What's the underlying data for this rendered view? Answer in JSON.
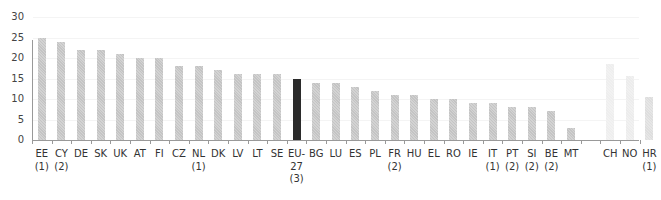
{
  "chart_data": {
    "type": "bar",
    "title": "",
    "xlabel": "",
    "ylabel": "",
    "ylim": [
      0,
      30
    ],
    "yticks": [
      0,
      5,
      10,
      15,
      20,
      25,
      30
    ],
    "grid": true,
    "legend": null,
    "categories": [
      "EE",
      "CY",
      "DE",
      "SK",
      "UK",
      "AT",
      "FI",
      "CZ",
      "NL",
      "DK",
      "LV",
      "LT",
      "SE",
      "EU-27",
      "BG",
      "LU",
      "ES",
      "PL",
      "FR",
      "HU",
      "EL",
      "RO",
      "IE",
      "IT",
      "PT",
      "SI",
      "BE",
      "MT",
      "CH",
      "NO",
      "HR"
    ],
    "footnotes": [
      "(1)",
      "(2)",
      "",
      "",
      "",
      "",
      "",
      "",
      "(1)",
      "",
      "",
      "",
      "",
      "27 (3)",
      "",
      "",
      "",
      "",
      "(2)",
      "",
      "",
      "",
      "",
      "(1)",
      "(2)",
      "(2)",
      "(2)",
      "",
      "",
      "",
      "(1)"
    ],
    "values": [
      25,
      24,
      22,
      22,
      21,
      20,
      20,
      18,
      18,
      17,
      16,
      16,
      16,
      15,
      14,
      14,
      13,
      12,
      11,
      11,
      10,
      10,
      9,
      9,
      8,
      8,
      7,
      3,
      18.5,
      15.6,
      10.5
    ],
    "groups": {
      "eu_members": [
        "EE",
        "CY",
        "DE",
        "SK",
        "UK",
        "AT",
        "FI",
        "CZ",
        "NL",
        "DK",
        "LV",
        "LT",
        "SE",
        "BG",
        "LU",
        "ES",
        "PL",
        "FR",
        "HU",
        "EL",
        "RO",
        "IE",
        "IT",
        "PT",
        "SI",
        "BE",
        "MT"
      ],
      "eu_aggregate": [
        "EU-27"
      ],
      "non_eu": [
        "CH",
        "NO",
        "HR"
      ]
    },
    "colors": {
      "eu_members": "#c4c4c4",
      "eu_aggregate": "#2b2b2b",
      "CH": "#eeeeee",
      "NO": "#ececec",
      "HR": "#dedede",
      "axis": "#999999"
    }
  },
  "axis": {
    "y_labels": [
      "30",
      "25",
      "20",
      "15",
      "10",
      "5",
      "0"
    ]
  },
  "labels": [
    {
      "code": "EE",
      "note": "(1)"
    },
    {
      "code": "CY",
      "note": "(2)"
    },
    {
      "code": "DE",
      "note": ""
    },
    {
      "code": "SK",
      "note": ""
    },
    {
      "code": "UK",
      "note": ""
    },
    {
      "code": "AT",
      "note": ""
    },
    {
      "code": "FI",
      "note": ""
    },
    {
      "code": "CZ",
      "note": ""
    },
    {
      "code": "NL",
      "note": "(1)"
    },
    {
      "code": "DK",
      "note": ""
    },
    {
      "code": "LV",
      "note": ""
    },
    {
      "code": "LT",
      "note": ""
    },
    {
      "code": "SE",
      "note": ""
    },
    {
      "code": "EU-",
      "note": "27",
      "note2": "(3)"
    },
    {
      "code": "BG",
      "note": ""
    },
    {
      "code": "LU",
      "note": ""
    },
    {
      "code": "ES",
      "note": ""
    },
    {
      "code": "PL",
      "note": ""
    },
    {
      "code": "FR",
      "note": "(2)"
    },
    {
      "code": "HU",
      "note": ""
    },
    {
      "code": "EL",
      "note": ""
    },
    {
      "code": "RO",
      "note": ""
    },
    {
      "code": "IE",
      "note": ""
    },
    {
      "code": "IT",
      "note": "(1)"
    },
    {
      "code": "PT",
      "note": "(2)"
    },
    {
      "code": "SI",
      "note": "(2)"
    },
    {
      "code": "BE",
      "note": "(2)"
    },
    {
      "code": "MT",
      "note": ""
    },
    {
      "code": "CH",
      "note": ""
    },
    {
      "code": "NO",
      "note": ""
    },
    {
      "code": "HR",
      "note": "(1)"
    }
  ]
}
